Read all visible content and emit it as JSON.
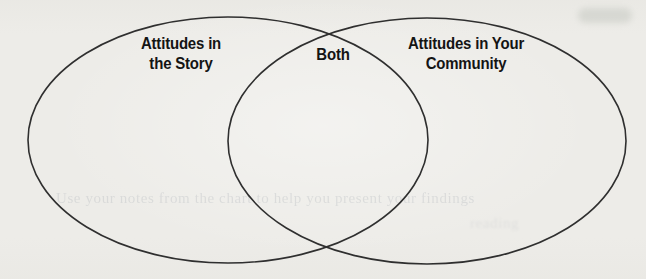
{
  "page": {
    "background_color": "#edece8",
    "line_color": "#2f2f2f",
    "text_color": "#141414"
  },
  "venn": {
    "left_circle": {
      "label_line1": "Attitudes in",
      "label_line2": "the Story"
    },
    "overlap": {
      "label": "Both"
    },
    "right_circle": {
      "label_line1": "Attitudes in Your",
      "label_line2": "Community"
    }
  },
  "bleed_through": {
    "line1": "Use your notes from the chart to help you present your findings",
    "line2": "reading"
  }
}
